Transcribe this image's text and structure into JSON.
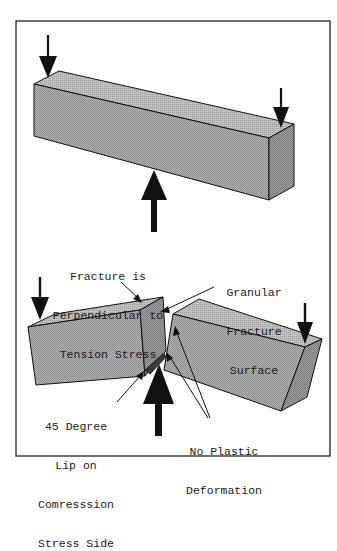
{
  "figure": {
    "colors": {
      "frame": "#222222",
      "block_fill": "#a8a8a8",
      "block_top": "#bdbdbd",
      "block_side": "#9a9a9a",
      "lip_fill": "#3a3a3a",
      "stroke": "#111111",
      "arrow": "#111111",
      "background": "#ffffff"
    },
    "labels": {
      "fracture_perpendicular": {
        "lines": [
          "Fracture is",
          "Perpendicular to",
          "Tension Stress"
        ]
      },
      "granular_surface": {
        "lines": [
          "Granular",
          "Fracture",
          "Surface"
        ]
      },
      "lip_compression": {
        "lines": [
          "45 Degree",
          "Lip on",
          "Comresssion",
          "Stress Side"
        ]
      },
      "no_plastic": {
        "lines": [
          "No Plastic",
          "Deformation"
        ]
      }
    }
  }
}
